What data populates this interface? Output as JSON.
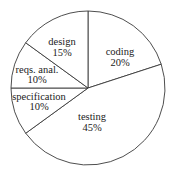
{
  "chart_data": {
    "type": "pie",
    "title": "",
    "start_angle_deg": 0,
    "direction": "clockwise",
    "center": [
      88,
      88
    ],
    "radius": 77,
    "colors": {
      "fill": "#ffffff",
      "stroke": "#3a3a3a",
      "text": "#222222"
    },
    "legend": "none (labels inside slices)",
    "slices": [
      {
        "label": "coding",
        "value": 20,
        "value_label": "20%",
        "label_pos": [
          120,
          55
        ],
        "value_pos": [
          120,
          66
        ]
      },
      {
        "label": "testing",
        "value": 45,
        "value_label": "45%",
        "label_pos": [
          92,
          120
        ],
        "value_pos": [
          92,
          131
        ]
      },
      {
        "label": "specification",
        "value": 10,
        "value_label": "10%",
        "label_pos": [
          39,
          100
        ],
        "value_pos": [
          39,
          110
        ]
      },
      {
        "label": "reqs. anal.",
        "value": 10,
        "value_label": "10%",
        "label_pos": [
          37,
          73
        ],
        "value_pos": [
          37,
          83
        ]
      },
      {
        "label": "design",
        "value": 15,
        "value_label": "15%",
        "label_pos": [
          62,
          45
        ],
        "value_pos": [
          62,
          56
        ]
      }
    ],
    "categories": [
      "coding",
      "testing",
      "specification",
      "reqs. anal.",
      "design"
    ],
    "values": [
      20,
      45,
      10,
      10,
      15
    ],
    "unit": "%"
  }
}
